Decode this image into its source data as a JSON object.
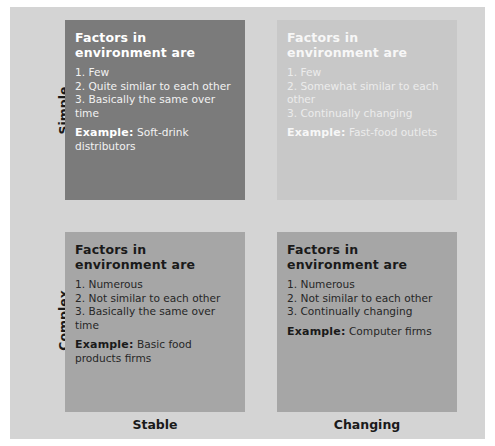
{
  "rows": {
    "simple": "Simple",
    "complex": "Complex"
  },
  "columns": {
    "stable": "Stable",
    "changing": "Changing"
  },
  "cells": {
    "simple_stable": {
      "heading": "Factors in environment are",
      "items": [
        "1. Few",
        "2. Quite similar to each other",
        "3. Basically the same over time"
      ],
      "example_label": "Example:",
      "example_text": " Soft-drink distributors"
    },
    "simple_changing": {
      "heading": "Factors in environment are",
      "items": [
        "1. Few",
        "2. Somewhat similar to each other",
        "3. Continually changing"
      ],
      "example_label": "Example:",
      "example_text": " Fast-food outlets"
    },
    "complex_stable": {
      "heading": "Factors in environment are",
      "items": [
        "1. Numerous",
        "2. Not similar to each other",
        "3. Basically the same over time"
      ],
      "example_label": "Example:",
      "example_text": " Basic food products firms"
    },
    "complex_changing": {
      "heading": "Factors in environment are",
      "items": [
        "1. Numerous",
        "2. Not similar to each other",
        "3. Continually changing"
      ],
      "example_label": "Example:",
      "example_text": " Computer firms"
    }
  },
  "colors": {
    "panel": "#d4d4d4",
    "simple_stable": "#7b7b7b",
    "simple_changing": "#c8c8c8",
    "complex": "#a6a6a6"
  }
}
